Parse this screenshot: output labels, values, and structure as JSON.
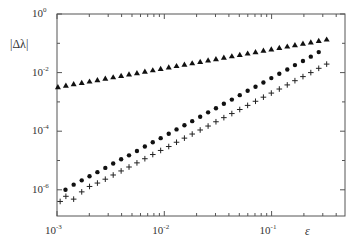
{
  "chart_data": {
    "type": "scatter",
    "title": "",
    "xlabel": "ε",
    "ylabel": "|Δλ|",
    "xscale": "log",
    "yscale": "log",
    "xlim": [
      0.001,
      0.49
    ],
    "ylim": [
      1.3e-07,
      1
    ],
    "x_ticks": [
      {
        "base": "10",
        "exp": "-3",
        "value": 0.001
      },
      {
        "base": "10",
        "exp": "-2",
        "value": 0.01
      },
      {
        "base": "10",
        "exp": "-1",
        "value": 0.1
      }
    ],
    "y_ticks": [
      {
        "base": "10",
        "exp": "0",
        "value": 1
      },
      {
        "base": "10",
        "exp": "-2",
        "value": 0.01
      },
      {
        "base": "10",
        "exp": "-4",
        "value": 0.0001
      },
      {
        "base": "10",
        "exp": "-6",
        "value": 1e-06
      }
    ],
    "grid": false,
    "legend": null,
    "series": [
      {
        "name": "triangles",
        "marker": "triangle",
        "x": [
          0.00102,
          0.00121,
          0.00143,
          0.0017,
          0.00201,
          0.00238,
          0.00282,
          0.00334,
          0.00396,
          0.00469,
          0.00556,
          0.00659,
          0.00781,
          0.00925,
          0.011,
          0.013,
          0.0154,
          0.0182,
          0.0216,
          0.0256,
          0.0303,
          0.0359,
          0.0426,
          0.0505,
          0.0598,
          0.0708,
          0.0839,
          0.0994,
          0.118,
          0.14,
          0.165,
          0.196,
          0.232,
          0.275,
          0.326
        ],
        "y": [
          0.0032,
          0.0036,
          0.0041,
          0.0045,
          0.005,
          0.0056,
          0.0063,
          0.007,
          0.0078,
          0.0087,
          0.0097,
          0.0109,
          0.0121,
          0.0135,
          0.0151,
          0.0169,
          0.0188,
          0.021,
          0.0234,
          0.0262,
          0.0292,
          0.0326,
          0.0364,
          0.0406,
          0.0453,
          0.0506,
          0.0565,
          0.063,
          0.0703,
          0.0785,
          0.0876,
          0.0978,
          0.109,
          0.122,
          0.136
        ]
      },
      {
        "name": "dots",
        "marker": "circle",
        "x": [
          0.0012,
          0.00143,
          0.0017,
          0.00201,
          0.00238,
          0.00282,
          0.00334,
          0.00396,
          0.00469,
          0.00556,
          0.00659,
          0.00781,
          0.00925,
          0.011,
          0.013,
          0.0154,
          0.0182,
          0.0216,
          0.0256,
          0.0303,
          0.0359,
          0.0426,
          0.0505,
          0.0598,
          0.0708,
          0.0839,
          0.0994,
          0.118,
          0.14,
          0.165,
          0.196,
          0.232,
          0.275
        ],
        "y": [
          1e-06,
          1.5e-06,
          2.1e-06,
          2.9e-06,
          4e-06,
          5.6e-06,
          7.9e-06,
          1.1e-05,
          1.5e-05,
          2.1e-05,
          3e-05,
          4.2e-05,
          5.8e-05,
          8.2e-05,
          0.000115,
          0.00016,
          0.00022,
          0.00031,
          0.00044,
          0.00061,
          0.00086,
          0.0012,
          0.0017,
          0.0024,
          0.0033,
          0.0046,
          0.0065,
          0.0091,
          0.0128,
          0.018,
          0.025,
          0.035,
          0.05
        ]
      },
      {
        "name": "plus",
        "marker": "plus",
        "x": [
          0.00107,
          0.00121,
          0.00143,
          0.0017,
          0.00201,
          0.00238,
          0.00282,
          0.00334,
          0.00396,
          0.00469,
          0.00556,
          0.00659,
          0.00781,
          0.00925,
          0.011,
          0.013,
          0.0154,
          0.0182,
          0.0216,
          0.0256,
          0.0303,
          0.0359,
          0.0426,
          0.0505,
          0.0598,
          0.0708,
          0.0839,
          0.0994,
          0.118,
          0.14,
          0.165,
          0.196,
          0.232,
          0.275,
          0.326
        ],
        "y": [
          4e-07,
          6e-07,
          4.8e-07,
          8.5e-07,
          1.3e-06,
          1.7e-06,
          2.3e-06,
          3.2e-06,
          4.4e-06,
          6e-06,
          8.3e-06,
          1.15e-05,
          1.6e-05,
          2.2e-05,
          3e-05,
          4.2e-05,
          5.8e-05,
          8e-05,
          0.00011,
          0.00015,
          0.00021,
          0.00029,
          0.0004,
          0.00055,
          0.00076,
          0.00105,
          0.00145,
          0.002,
          0.00275,
          0.0038,
          0.0053,
          0.0073,
          0.01,
          0.014,
          0.0195
        ]
      }
    ]
  },
  "labels": {
    "ylabel": "|Δλ|",
    "xlabel": "ε"
  }
}
